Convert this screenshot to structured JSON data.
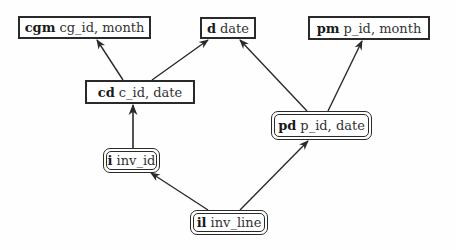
{
  "diagram": {
    "type": "dependency-lattice",
    "nodes": [
      {
        "id": "cgm",
        "abbr": "cgm",
        "attrs": "cg_id, month",
        "shape": "rect"
      },
      {
        "id": "d",
        "abbr": "d",
        "attrs": "date",
        "shape": "rect"
      },
      {
        "id": "pm",
        "abbr": "pm",
        "attrs": "p_id, month",
        "shape": "rect"
      },
      {
        "id": "cd",
        "abbr": "cd",
        "attrs": "c_id, date",
        "shape": "rect"
      },
      {
        "id": "pd",
        "abbr": "pd",
        "attrs": "p_id, date",
        "shape": "double-rounded"
      },
      {
        "id": "i",
        "abbr": "i",
        "attrs": "inv_id",
        "shape": "double-rounded"
      },
      {
        "id": "il",
        "abbr": "il",
        "attrs": "inv_line",
        "shape": "double-rounded"
      }
    ],
    "edges": [
      {
        "from": "cd",
        "to": "cgm"
      },
      {
        "from": "cd",
        "to": "d"
      },
      {
        "from": "pd",
        "to": "d"
      },
      {
        "from": "pd",
        "to": "pm"
      },
      {
        "from": "i",
        "to": "cd"
      },
      {
        "from": "il",
        "to": "i"
      },
      {
        "from": "il",
        "to": "pd"
      }
    ]
  },
  "nodes": {
    "cgm": {
      "abbr": "cgm",
      "attrs": "cg_id, month"
    },
    "d": {
      "abbr": "d",
      "attrs": "date"
    },
    "pm": {
      "abbr": "pm",
      "attrs": "p_id, month"
    },
    "cd": {
      "abbr": "cd",
      "attrs": "c_id, date"
    },
    "pd": {
      "abbr": "pd",
      "attrs": "p_id, date"
    },
    "i": {
      "abbr": "i",
      "attrs": "inv_id"
    },
    "il": {
      "abbr": "il",
      "attrs": "inv_line"
    }
  },
  "colors": {
    "stroke": "#2a2a2a",
    "background": "#fefefe"
  }
}
